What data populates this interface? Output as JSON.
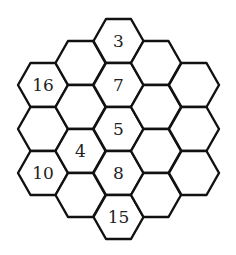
{
  "puzzle": {
    "type": "hexagonal-number-grid",
    "hex": {
      "half_width": 25,
      "half_height": 22,
      "column_spacing": 37.75,
      "row_spacing": 44
    },
    "colors": {
      "stroke": "#111111",
      "fill": "#ffffff",
      "text": "#222222"
    },
    "columns": [
      {
        "cx": 43,
        "cells": [
          {
            "cy": 85,
            "label": "16"
          },
          {
            "cy": 129,
            "label": ""
          },
          {
            "cy": 173,
            "label": "10"
          }
        ]
      },
      {
        "cx": 80.5,
        "cells": [
          {
            "cy": 63,
            "label": ""
          },
          {
            "cy": 107,
            "label": ""
          },
          {
            "cy": 151,
            "label": "4"
          },
          {
            "cy": 195,
            "label": ""
          }
        ]
      },
      {
        "cx": 118.5,
        "cells": [
          {
            "cy": 41,
            "label": "3"
          },
          {
            "cy": 85,
            "label": "7"
          },
          {
            "cy": 129,
            "label": "5"
          },
          {
            "cy": 173,
            "label": "8"
          },
          {
            "cy": 217,
            "label": "15"
          }
        ]
      },
      {
        "cx": 156,
        "cells": [
          {
            "cy": 63,
            "label": ""
          },
          {
            "cy": 107,
            "label": ""
          },
          {
            "cy": 151,
            "label": ""
          },
          {
            "cy": 195,
            "label": ""
          }
        ]
      },
      {
        "cx": 194,
        "cells": [
          {
            "cy": 85,
            "label": ""
          },
          {
            "cy": 129,
            "label": ""
          },
          {
            "cy": 173,
            "label": ""
          }
        ]
      }
    ]
  }
}
